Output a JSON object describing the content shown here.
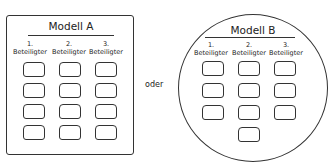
{
  "connector": "oder",
  "models": [
    {
      "title": "Modell A",
      "shape": "rectangle",
      "columns": [
        {
          "number": "1.",
          "label": "Beteiligter",
          "slots": 4
        },
        {
          "number": "2.",
          "label": "Beteiligter",
          "slots": 4
        },
        {
          "number": "3.",
          "label": "Beteiligter",
          "slots": 4
        }
      ]
    },
    {
      "title": "Modell B",
      "shape": "circle",
      "columns": [
        {
          "number": "1.",
          "label": "Beteiligter",
          "slots": 3
        },
        {
          "number": "2.",
          "label": "Beteiligter",
          "slots": 4
        },
        {
          "number": "3.",
          "label": "Beteiligter",
          "slots": 3
        }
      ]
    }
  ]
}
